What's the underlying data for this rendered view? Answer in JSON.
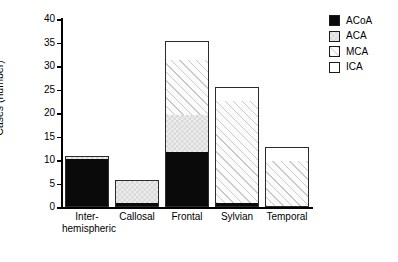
{
  "chart_data": {
    "type": "bar",
    "stacked": true,
    "title": "",
    "xlabel": "",
    "ylabel": "Cases (number)",
    "ylim": [
      0,
      40
    ],
    "ytick_step": 5,
    "yticks": [
      0,
      5,
      10,
      15,
      20,
      25,
      30,
      35,
      40
    ],
    "grid": false,
    "legend_position": "top-right",
    "categories": [
      "Inter-\nhemispheric",
      "Callosal",
      "Frontal",
      "Sylvian",
      "Temporal"
    ],
    "series": [
      {
        "name": "ACoA",
        "pattern": "solid-black",
        "color": "#0a0a0a",
        "values": [
          10.5,
          1,
          12,
          1,
          0
        ]
      },
      {
        "name": "ACA",
        "pattern": "checkerboard",
        "color": "#d9d9d9",
        "values": [
          0.5,
          5,
          8,
          0,
          0
        ]
      },
      {
        "name": "MCA",
        "pattern": "diagonal-hatch",
        "color": "#fbfbfb",
        "values": [
          0,
          0,
          12,
          22,
          10
        ]
      },
      {
        "name": "ICA",
        "pattern": "white",
        "color": "#ffffff",
        "values": [
          0,
          0,
          4,
          3,
          3
        ]
      }
    ],
    "totals": [
      11,
      6,
      36,
      26,
      13
    ]
  },
  "legend": {
    "items": [
      {
        "label": "ACoA"
      },
      {
        "label": "ACA"
      },
      {
        "label": "MCA"
      },
      {
        "label": "ICA"
      }
    ]
  }
}
